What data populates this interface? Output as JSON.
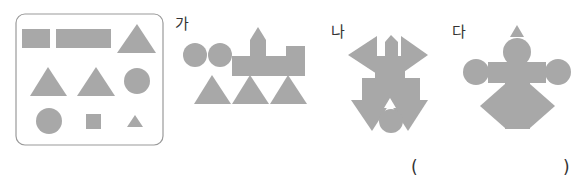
{
  "colors": {
    "shape_fill": "#a8a8a8",
    "panel_border": "#9a9a9a",
    "text": "#333333"
  },
  "shape_panel": {
    "shapes": [
      {
        "type": "rectangle",
        "size": "medium"
      },
      {
        "type": "rectangle",
        "size": "long"
      },
      {
        "type": "triangle",
        "size": "large"
      },
      {
        "type": "triangle",
        "size": "large"
      },
      {
        "type": "triangle",
        "size": "large"
      },
      {
        "type": "circle",
        "size": "medium"
      },
      {
        "type": "circle",
        "size": "medium"
      },
      {
        "type": "square",
        "size": "small"
      },
      {
        "type": "triangle",
        "size": "small"
      }
    ]
  },
  "options": [
    {
      "label": "가",
      "description": "train made of circles, rectangles, a square and triangles"
    },
    {
      "label": "나",
      "description": "figure made of triangles, rectangles and a circle"
    },
    {
      "label": "다",
      "description": "figure made of circles, rectangles and triangles"
    }
  ],
  "answer": {
    "open_paren": "(",
    "close_paren": ")",
    "value": ""
  }
}
